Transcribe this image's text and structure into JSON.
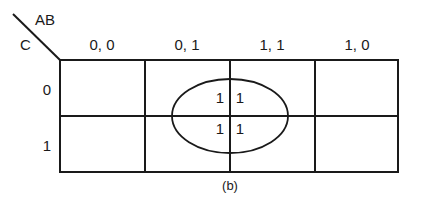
{
  "diagram": {
    "type": "karnaugh-map",
    "corner": {
      "column_variables": "AB",
      "row_variable": "C"
    },
    "column_headers": [
      "0, 0",
      "0, 1",
      "1, 1",
      "1, 0"
    ],
    "row_headers": [
      "0",
      "1"
    ],
    "cells": [
      [
        "",
        "1",
        "1",
        ""
      ],
      [
        "",
        "1",
        "1",
        ""
      ]
    ],
    "grouping": {
      "shape": "ellipse",
      "covers": "columns 0,1 and 1,1; rows 0 and 1"
    },
    "caption": "(b)"
  }
}
